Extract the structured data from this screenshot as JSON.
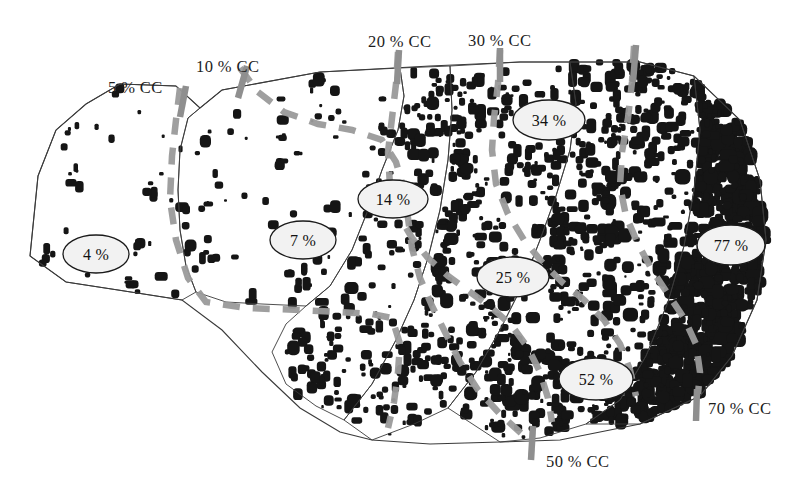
{
  "figure": {
    "kind": "canopy-cover-density-map",
    "background_color": "#ffffff",
    "dot_color": "#151515",
    "outline_color": "#3a3a3a",
    "contour_color": "#9a9a9a",
    "tick_color": "#8f8f8f",
    "ellipse_fill": "#f2f2f2",
    "ellipse_stroke": "#1a1a1a",
    "width": 809,
    "height": 494
  },
  "cc_ticks": [
    {
      "id": "cc-5",
      "label": "5 % CC",
      "label_x": 108,
      "label_y": 78,
      "tick_x": 186,
      "tick_y": 86,
      "tick_x2": 180,
      "tick_y2": 117
    },
    {
      "id": "cc-10",
      "label": "10 % CC",
      "label_x": 196,
      "label_y": 57,
      "tick_x": 247,
      "tick_y": 66,
      "tick_x2": 238,
      "tick_y2": 98
    },
    {
      "id": "cc-20",
      "label": "20 % CC",
      "label_x": 368,
      "label_y": 32,
      "tick_x": 399,
      "tick_y": 50,
      "tick_x2": 397,
      "tick_y2": 84
    },
    {
      "id": "cc-30",
      "label": "30 % CC",
      "label_x": 468,
      "label_y": 31,
      "tick_x": 500,
      "tick_y": 48,
      "tick_x2": 500,
      "tick_y2": 82
    },
    {
      "id": "cc-40",
      "label": "",
      "label_x": 0,
      "label_y": 0,
      "tick_x": 636,
      "tick_y": 45,
      "tick_x2": 633,
      "tick_y2": 82
    },
    {
      "id": "cc-50",
      "label": "50 % CC",
      "label_x": 546,
      "label_y": 452,
      "tick_x": 533,
      "tick_y": 426,
      "tick_x2": 531,
      "tick_y2": 460
    },
    {
      "id": "cc-70",
      "label": "70 % CC",
      "label_x": 708,
      "label_y": 399,
      "tick_x": 697,
      "tick_y": 389,
      "tick_x2": 696,
      "tick_y2": 421
    }
  ],
  "zone_labels": [
    {
      "id": "zone-4",
      "value": "4 %",
      "cx": 96,
      "cy": 254,
      "rx": 33,
      "ry": 19
    },
    {
      "id": "zone-7",
      "value": "7 %",
      "cx": 303,
      "cy": 240,
      "rx": 33,
      "ry": 19
    },
    {
      "id": "zone-14",
      "value": "14 %",
      "cx": 393,
      "cy": 199,
      "rx": 35,
      "ry": 19
    },
    {
      "id": "zone-34",
      "value": "34 %",
      "cx": 549,
      "cy": 120,
      "rx": 36,
      "ry": 20
    },
    {
      "id": "zone-25",
      "value": "25 %",
      "cx": 513,
      "cy": 277,
      "rx": 36,
      "ry": 20
    },
    {
      "id": "zone-52",
      "value": "52 %",
      "cx": 596,
      "cy": 379,
      "rx": 37,
      "ry": 21
    },
    {
      "id": "zone-77",
      "value": "77 %",
      "cx": 731,
      "cy": 245,
      "rx": 34,
      "ry": 20
    }
  ],
  "chart_data": {
    "type": "map",
    "title": "",
    "legend": [],
    "units": "% CC (percent canopy cover)",
    "classes": [
      {
        "label": "4 %",
        "canopy_cover_percent": 4
      },
      {
        "label": "7 %",
        "canopy_cover_percent": 7
      },
      {
        "label": "14 %",
        "canopy_cover_percent": 14
      },
      {
        "label": "25 %",
        "canopy_cover_percent": 25
      },
      {
        "label": "34 %",
        "canopy_cover_percent": 34
      },
      {
        "label": "52 %",
        "canopy_cover_percent": 52
      },
      {
        "label": "77 %",
        "canopy_cover_percent": 77
      }
    ],
    "contour_levels": [
      5,
      10,
      20,
      30,
      40,
      50,
      70
    ],
    "contour_labels": [
      "5 % CC",
      "10 % CC",
      "20 % CC",
      "30 % CC",
      "",
      "50 % CC",
      "70 % CC"
    ]
  },
  "geometry": {
    "outer_boundary": "M 30 256 L 38 176 L 56 130 L 86 104 L 120 84 L 176 86 L 200 108 L 222 90 L 320 72 L 430 66 L 520 62 L 640 62 L 694 76 L 740 120 L 760 180 L 766 240 L 757 300 L 732 356 L 700 396 L 640 424 L 560 440 L 500 442 L 430 444 L 372 440 L 340 432 L 300 408 L 262 372 L 222 330 L 182 300 L 118 290 L 66 282 Z",
    "region_paths": [
      "M 120 84 L 176 86 L 200 108 L 188 118 L 180 150 L 178 190 L 180 230 L 186 266 L 196 292 L 182 300 L 118 290 L 66 282 L 30 256 L 38 176 L 56 130 L 86 104 Z",
      "M 200 108 L 222 90 L 320 72 L 400 68 L 404 96 L 398 130 L 382 170 L 368 210 L 352 250 L 330 286 L 306 306 L 262 304 L 226 302 L 196 292 L 186 266 L 180 230 L 178 190 L 180 150 L 188 118 Z",
      "M 306 306 L 330 286 L 352 250 L 368 210 L 382 170 L 398 130 L 404 96 L 400 68 L 450 66 L 452 110 L 448 160 L 440 210 L 428 258 L 414 300 L 396 340 L 372 384 L 344 420 L 316 406 L 286 384 L 272 352 L 286 324 Z",
      "M 450 66 L 520 62 L 570 62 L 576 104 L 570 150 L 556 196 L 540 240 L 522 286 L 500 330 L 476 372 L 448 408 L 414 424 L 372 440 L 344 420 L 372 384 L 396 340 L 414 300 L 428 258 L 440 210 L 448 160 L 452 110 Z",
      "M 570 62 L 640 62 L 694 76 L 700 130 L 694 190 L 684 246 L 668 302 L 646 356 L 620 400 L 586 424 L 540 438 L 500 442 L 448 408 L 476 372 L 500 330 L 522 286 L 540 240 L 556 196 L 570 150 L 576 104 Z",
      "M 694 76 L 740 120 L 760 180 L 766 240 L 757 300 L 732 356 L 700 396 L 640 424 L 586 424 L 620 400 L 646 356 L 668 302 L 684 246 L 694 190 L 700 130 Z"
    ],
    "contour_paths": [
      "M 180 88 L 176 120 L 172 156 L 170 200 L 176 240 L 188 278 L 206 302 L 246 308 L 300 310 L 340 312 L 372 314 L 392 318 L 400 344 L 398 372 L 394 402 L 388 428",
      "M 240 68 L 258 92 L 284 112 L 318 124 L 352 130 L 382 140 L 396 162 L 404 190 L 408 218 L 412 248 L 420 278 L 432 306 L 446 334 L 460 362 L 478 390 L 500 414 L 522 434",
      "M 398 52 L 396 84 L 392 118 L 388 152 L 390 186 L 398 214 L 412 238 L 428 258 L 448 276 L 470 292 L 492 308 L 512 326 L 528 348 L 540 372 L 548 398 L 552 422",
      "M 500 50 L 498 84 L 494 118 L 492 150 L 496 184 L 508 214 L 524 240 L 542 262 L 562 282 L 584 300 L 604 320 L 620 344 L 630 370 L 636 396",
      "M 634 46 L 632 82 L 628 118 L 622 152 L 620 186 L 626 216 L 638 244 L 652 270 L 668 294 L 684 318 L 696 344 L 700 372 L 698 394"
    ],
    "density_regions": [
      {
        "id": "r4",
        "dots": 40,
        "size_min": 3,
        "size_max": 10,
        "clump": 1.0,
        "poly": [
          [
            30,
            256
          ],
          [
            38,
            176
          ],
          [
            56,
            130
          ],
          [
            86,
            104
          ],
          [
            120,
            84
          ],
          [
            176,
            86
          ],
          [
            200,
            108
          ],
          [
            188,
            118
          ],
          [
            180,
            160
          ],
          [
            178,
            210
          ],
          [
            186,
            266
          ],
          [
            196,
            292
          ],
          [
            182,
            300
          ],
          [
            118,
            290
          ],
          [
            66,
            282
          ]
        ]
      },
      {
        "id": "r7",
        "dots": 90,
        "size_min": 3,
        "size_max": 11,
        "clump": 1.1,
        "poly": [
          [
            200,
            108
          ],
          [
            222,
            90
          ],
          [
            320,
            72
          ],
          [
            400,
            68
          ],
          [
            404,
            96
          ],
          [
            392,
            150
          ],
          [
            372,
            205
          ],
          [
            350,
            255
          ],
          [
            326,
            292
          ],
          [
            306,
            306
          ],
          [
            262,
            304
          ],
          [
            218,
            300
          ],
          [
            192,
            290
          ],
          [
            182,
            250
          ],
          [
            178,
            190
          ],
          [
            188,
            118
          ]
        ]
      },
      {
        "id": "r14",
        "dots": 175,
        "size_min": 3,
        "size_max": 11,
        "clump": 1.2,
        "poly": [
          [
            400,
            68
          ],
          [
            450,
            66
          ],
          [
            452,
            110
          ],
          [
            446,
            165
          ],
          [
            436,
            220
          ],
          [
            422,
            272
          ],
          [
            406,
            320
          ],
          [
            386,
            366
          ],
          [
            360,
            406
          ],
          [
            330,
            414
          ],
          [
            298,
            398
          ],
          [
            276,
            368
          ],
          [
            282,
            330
          ],
          [
            310,
            306
          ],
          [
            336,
            282
          ],
          [
            358,
            240
          ],
          [
            378,
            190
          ],
          [
            394,
            138
          ],
          [
            402,
            98
          ]
        ]
      },
      {
        "id": "r25",
        "dots": 330,
        "size_min": 3,
        "size_max": 11,
        "clump": 1.3,
        "poly": [
          [
            450,
            66
          ],
          [
            520,
            62
          ],
          [
            570,
            62
          ],
          [
            574,
            110
          ],
          [
            566,
            162
          ],
          [
            552,
            214
          ],
          [
            534,
            266
          ],
          [
            512,
            316
          ],
          [
            488,
            364
          ],
          [
            460,
            404
          ],
          [
            424,
            424
          ],
          [
            384,
            436
          ],
          [
            352,
            424
          ],
          [
            372,
            384
          ],
          [
            398,
            340
          ],
          [
            416,
            298
          ],
          [
            430,
            252
          ],
          [
            442,
            200
          ],
          [
            450,
            146
          ],
          [
            452,
            100
          ]
        ]
      },
      {
        "id": "r34",
        "dots": 520,
        "size_min": 3,
        "size_max": 12,
        "clump": 1.45,
        "poly": [
          [
            570,
            62
          ],
          [
            640,
            62
          ],
          [
            694,
            76
          ],
          [
            700,
            132
          ],
          [
            692,
            192
          ],
          [
            680,
            250
          ],
          [
            664,
            306
          ],
          [
            642,
            358
          ],
          [
            616,
            400
          ],
          [
            584,
            422
          ],
          [
            540,
            436
          ],
          [
            500,
            440
          ],
          [
            452,
            410
          ],
          [
            478,
            370
          ],
          [
            502,
            328
          ],
          [
            524,
            284
          ],
          [
            542,
            238
          ],
          [
            558,
            192
          ],
          [
            570,
            146
          ],
          [
            576,
            104
          ]
        ]
      },
      {
        "id": "r77",
        "dots": 980,
        "size_min": 4,
        "size_max": 13,
        "clump": 1.7,
        "poly": [
          [
            694,
            76
          ],
          [
            740,
            120
          ],
          [
            760,
            180
          ],
          [
            766,
            240
          ],
          [
            757,
            300
          ],
          [
            732,
            356
          ],
          [
            700,
            396
          ],
          [
            642,
            423
          ],
          [
            588,
            424
          ],
          [
            620,
            398
          ],
          [
            646,
            354
          ],
          [
            668,
            300
          ],
          [
            684,
            244
          ],
          [
            694,
            188
          ],
          [
            700,
            130
          ]
        ]
      }
    ]
  }
}
